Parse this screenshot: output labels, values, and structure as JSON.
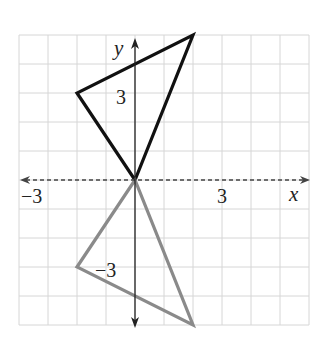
{
  "chart_data": {
    "type": "scatter",
    "title": "",
    "xlabel": "x",
    "ylabel": "y",
    "xlim": [
      -4,
      6
    ],
    "ylim": [
      -5,
      5
    ],
    "grid": true,
    "x_axis_style": "dashed",
    "tick_labels": {
      "x": [
        {
          "value": -3,
          "label": "−3"
        },
        {
          "value": 3,
          "label": "3"
        }
      ],
      "y": [
        {
          "value": 3,
          "label": "3"
        },
        {
          "value": -3,
          "label": "−3"
        }
      ]
    },
    "series": [
      {
        "name": "original triangle",
        "shape": "polygon",
        "color": "#111111",
        "points": [
          [
            0,
            0
          ],
          [
            -2,
            3
          ],
          [
            2,
            5
          ]
        ]
      },
      {
        "name": "reflected triangle",
        "shape": "polygon",
        "color": "#8a8a8a",
        "points": [
          [
            0,
            0
          ],
          [
            -2,
            -3
          ],
          [
            2,
            -5
          ]
        ]
      }
    ]
  },
  "axes": {
    "x_label": "x",
    "y_label": "y",
    "x_tick_neg": "−3",
    "x_tick_pos": "3",
    "y_tick_pos": "3",
    "y_tick_neg": "−3"
  }
}
